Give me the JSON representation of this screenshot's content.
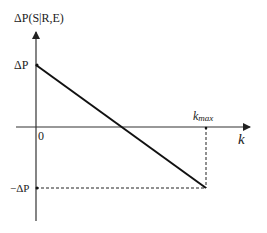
{
  "diagram": {
    "type": "function-plot",
    "y_axis_label": "ΔP(S|R,E)",
    "x_axis_label": "k",
    "origin_label": "0",
    "y_top_tick_label": "ΔP",
    "y_bottom_tick_label": "−ΔP",
    "x_tick_label": "k",
    "x_tick_subscript": "max",
    "line": {
      "from": {
        "k": 0,
        "value": "ΔP"
      },
      "to": {
        "k": "k_max",
        "value": "−ΔP"
      },
      "style": "solid"
    },
    "guides": [
      {
        "from": "(k_max, 0)",
        "to": "(k_max, −ΔP)",
        "style": "dashed"
      },
      {
        "from": "(0, −ΔP)",
        "to": "(k_max, −ΔP)",
        "style": "dashed"
      }
    ],
    "colors": {
      "line": "#111111",
      "axis": "#333333"
    }
  }
}
